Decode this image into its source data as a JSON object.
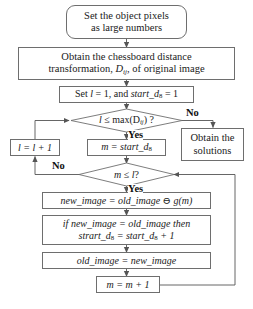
{
  "diagram": {
    "type": "flowchart",
    "colors": {
      "stroke": "#6e6e6e",
      "arrow": "#555555",
      "text": "#1a1a1a",
      "background": "#ffffff"
    }
  },
  "nodes": {
    "start": {
      "shape": "rounded-rectangle",
      "line1": "Set the object pixels",
      "line2": "as large numbers"
    },
    "distance_transform": {
      "shape": "rectangle",
      "line1": "Obtain the chessboard distance",
      "line2_pre": "transformation, ",
      "line2_var": "D",
      "line2_sub": "ij",
      "line2_post": ", of original image"
    },
    "init": {
      "shape": "rectangle",
      "pre": "Set ",
      "var_l": "l",
      "mid": " = 1, and ",
      "var_start": "start_d",
      "sub": "8",
      "post": " = 1"
    },
    "decision_l": {
      "shape": "diamond",
      "var_l": "l",
      "mid": " ≤ max(D",
      "sub": "ij",
      "post": ") ?"
    },
    "increment_l": {
      "shape": "rectangle",
      "var": "l",
      "text": " = l + 1"
    },
    "assign_m": {
      "shape": "rectangle",
      "var_m": "m",
      "mid": " = start_d",
      "sub": "8"
    },
    "obtain_solutions": {
      "shape": "rectangle",
      "line1": "Obtain the",
      "line2": "solutions"
    },
    "decision_m": {
      "shape": "diamond",
      "var_m": "m",
      "mid": " ≤ ",
      "var_l": "l",
      "post": "?"
    },
    "erosion": {
      "shape": "rectangle",
      "text": "new_image = old_image ⊖ g(m)"
    },
    "if_equal": {
      "shape": "rectangle",
      "line1": "if new_image = old_image then",
      "line2_pre": "strart_d",
      "line2_sub1": "8",
      "line2_mid": " = start_d",
      "line2_sub2": "8",
      "line2_post": " + 1"
    },
    "update_old": {
      "shape": "rectangle",
      "text": "old_image = new_image"
    },
    "increment_m": {
      "shape": "rectangle",
      "text": "m = m + 1"
    }
  },
  "edge_labels": {
    "decision_l_no": "No",
    "decision_l_yes": "Yes",
    "decision_m_no": "No",
    "decision_m_yes": "Yes"
  }
}
